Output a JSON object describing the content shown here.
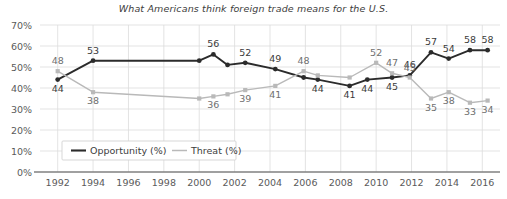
{
  "chart_data": {
    "type": "line",
    "title": "What Americans think foreign trade means for the U.S.",
    "xlabel": "",
    "ylabel": "",
    "xlim": [
      1991,
      2017
    ],
    "ylim": [
      0,
      70
    ],
    "grid": true,
    "legend_position": "bottom-left",
    "y_ticks": [
      "0%",
      "10%",
      "20%",
      "30%",
      "40%",
      "50%",
      "60%",
      "70%"
    ],
    "y_tick_values": [
      0,
      10,
      20,
      30,
      40,
      50,
      60,
      70
    ],
    "x_ticks": [
      "1992",
      "1994",
      "1996",
      "1998",
      "2000",
      "2002",
      "2004",
      "2006",
      "2008",
      "2010",
      "2012",
      "2014",
      "2016"
    ],
    "x_tick_values": [
      1992,
      1994,
      1996,
      1998,
      2000,
      2002,
      2004,
      2006,
      2008,
      2010,
      2012,
      2014,
      2016
    ],
    "series": [
      {
        "name": "Opportunity (%)",
        "color": "#2b2b2b",
        "points": [
          {
            "x": 1992.0,
            "y": 44,
            "label": "44",
            "label_pos": "below"
          },
          {
            "x": 1994.0,
            "y": 53,
            "label": "53",
            "label_pos": "above"
          },
          {
            "x": 2000.0,
            "y": 53,
            "label": "",
            "label_pos": "above"
          },
          {
            "x": 2000.8,
            "y": 56,
            "label": "56",
            "label_pos": "above"
          },
          {
            "x": 2001.6,
            "y": 51,
            "label": "",
            "label_pos": "below"
          },
          {
            "x": 2002.6,
            "y": 52,
            "label": "52",
            "label_pos": "above"
          },
          {
            "x": 2004.3,
            "y": 49,
            "label": "49",
            "label_pos": "above"
          },
          {
            "x": 2005.9,
            "y": 45,
            "label": "",
            "label_pos": "below"
          },
          {
            "x": 2006.7,
            "y": 44,
            "label": "44",
            "label_pos": "below"
          },
          {
            "x": 2008.5,
            "y": 41,
            "label": "41",
            "label_pos": "below"
          },
          {
            "x": 2009.5,
            "y": 44,
            "label": "44",
            "label_pos": "below"
          },
          {
            "x": 2010.9,
            "y": 45,
            "label": "45",
            "label_pos": "below"
          },
          {
            "x": 2011.9,
            "y": 46,
            "label": "46",
            "label_pos": "above"
          },
          {
            "x": 2013.1,
            "y": 57,
            "label": "57",
            "label_pos": "above"
          },
          {
            "x": 2014.1,
            "y": 54,
            "label": "54",
            "label_pos": "above"
          },
          {
            "x": 2015.3,
            "y": 58,
            "label": "58",
            "label_pos": "above"
          },
          {
            "x": 2016.3,
            "y": 58,
            "label": "58",
            "label_pos": "above"
          }
        ]
      },
      {
        "name": "Threat (%)",
        "color": "#b9b9b9",
        "points": [
          {
            "x": 1992.0,
            "y": 48,
            "label": "48",
            "label_pos": "above"
          },
          {
            "x": 1994.0,
            "y": 38,
            "label": "38",
            "label_pos": "below"
          },
          {
            "x": 2000.0,
            "y": 35,
            "label": "",
            "label_pos": "below"
          },
          {
            "x": 2000.8,
            "y": 36,
            "label": "36",
            "label_pos": "below"
          },
          {
            "x": 2001.6,
            "y": 37,
            "label": "",
            "label_pos": "below"
          },
          {
            "x": 2002.6,
            "y": 39,
            "label": "39",
            "label_pos": "below"
          },
          {
            "x": 2004.3,
            "y": 41,
            "label": "41",
            "label_pos": "below"
          },
          {
            "x": 2005.9,
            "y": 48,
            "label": "48",
            "label_pos": "above"
          },
          {
            "x": 2006.7,
            "y": 46,
            "label": "",
            "label_pos": "above"
          },
          {
            "x": 2008.5,
            "y": 45,
            "label": "",
            "label_pos": "above"
          },
          {
            "x": 2010.0,
            "y": 52,
            "label": "52",
            "label_pos": "above"
          },
          {
            "x": 2010.9,
            "y": 47,
            "label": "47",
            "label_pos": "above"
          },
          {
            "x": 2011.9,
            "y": 45,
            "label": "45",
            "label_pos": "above"
          },
          {
            "x": 2013.1,
            "y": 35,
            "label": "35",
            "label_pos": "below"
          },
          {
            "x": 2014.1,
            "y": 38,
            "label": "38",
            "label_pos": "below"
          },
          {
            "x": 2015.3,
            "y": 33,
            "label": "33",
            "label_pos": "below"
          },
          {
            "x": 2016.3,
            "y": 34,
            "label": "34",
            "label_pos": "below"
          }
        ]
      }
    ],
    "legend": [
      {
        "label": "Opportunity (%)",
        "color": "#2b2b2b"
      },
      {
        "label": "Threat (%)",
        "color": "#b9b9b9"
      }
    ]
  }
}
